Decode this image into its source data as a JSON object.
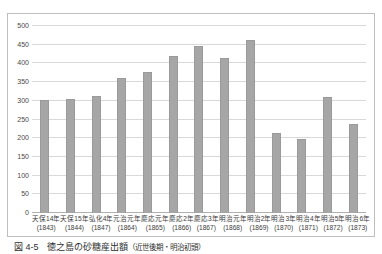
{
  "figure": {
    "caption_number": "図 4-5",
    "caption_title": "徳之島の砂糖産出額",
    "caption_subtitle": "（近世後期・明治初頭）",
    "unit_note": "単位：万斤"
  },
  "chart_data": {
    "type": "bar",
    "title": "徳之島の砂糖産出額（近世後期・明治初頭）",
    "xlabel": "",
    "ylabel": "",
    "unit": "万斤",
    "ylim": [
      0,
      500
    ],
    "yticks": [
      500,
      450,
      400,
      350,
      300,
      250,
      200,
      150,
      100,
      50,
      0
    ],
    "ytick_labels": [
      "500",
      "450",
      "400",
      "350",
      "300",
      "250",
      "200",
      "150",
      "100",
      "50",
      "0"
    ],
    "grid": true,
    "legend": "none",
    "bar_color": "#a6a6a6",
    "categories": [
      "天保14年",
      "天保15年",
      "弘化4年",
      "元治元年",
      "慶応元年",
      "慶応2年",
      "慶応3年",
      "明治元年",
      "明治2年",
      "明治3年",
      "明治4年",
      "明治5年",
      "明治6年"
    ],
    "category_years": [
      "(1843)",
      "(1844)",
      "(1847)",
      "(1864)",
      "(1865)",
      "(1866)",
      "(1867)",
      "(1868)",
      "(1869)",
      "(1870)",
      "(1871)",
      "(1872)",
      "(1873)"
    ],
    "values": [
      301,
      305,
      313,
      361,
      377,
      421,
      446,
      414,
      462,
      215,
      197,
      309,
      237
    ]
  }
}
